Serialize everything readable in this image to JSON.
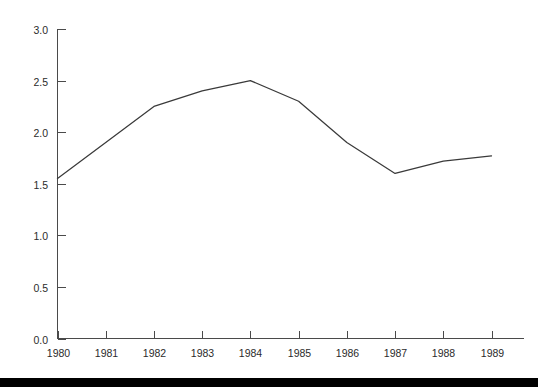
{
  "chart_data": {
    "type": "line",
    "title": "",
    "subtitle": "",
    "xlabel": "",
    "ylabel": "",
    "categories": [
      "1980",
      "1981",
      "1982",
      "1983",
      "1984",
      "1985",
      "1986",
      "1987",
      "1988",
      "1989"
    ],
    "x": [
      1980,
      1981,
      1982,
      1983,
      1984,
      1985,
      1986,
      1987,
      1988,
      1989
    ],
    "values": [
      1.55,
      1.9,
      2.25,
      2.4,
      2.5,
      2.3,
      1.9,
      1.6,
      1.72,
      1.77
    ],
    "series": [
      {
        "name": "",
        "values": [
          1.55,
          1.9,
          2.25,
          2.4,
          2.5,
          2.3,
          1.9,
          1.6,
          1.72,
          1.77
        ]
      }
    ],
    "ylim": [
      0.0,
      3.0
    ],
    "xlim": [
      1980,
      1989
    ],
    "ytick_labels": [
      "0.0",
      "0.5",
      "1.0",
      "1.5",
      "2.0",
      "2.5",
      "3.0"
    ],
    "ytick_values": [
      0.0,
      0.5,
      1.0,
      1.5,
      2.0,
      2.5,
      3.0
    ],
    "xtick_labels": [
      "1980",
      "1981",
      "1982",
      "1983",
      "1984",
      "1985",
      "1986",
      "1987",
      "1988",
      "1989"
    ],
    "grid": false,
    "legend": false,
    "legend_position": "none",
    "annotations": [],
    "line_color": "#3a3a3a",
    "axis_color": "#4a4a4a",
    "background_color": "#ffffff",
    "footer_bar_color": "#000000"
  }
}
